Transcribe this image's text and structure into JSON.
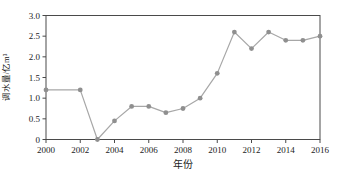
{
  "chart_data": {
    "type": "line",
    "title": "",
    "xlabel": "年份",
    "ylabel": "调水量/亿m³",
    "x": [
      2000,
      2002,
      2003,
      2004,
      2005,
      2006,
      2007,
      2008,
      2009,
      2010,
      2011,
      2012,
      2013,
      2014,
      2015,
      2016
    ],
    "values": [
      1.2,
      1.2,
      0,
      0.45,
      0.8,
      0.8,
      0.65,
      0.75,
      1.0,
      1.6,
      2.6,
      2.2,
      2.6,
      2.4,
      2.4,
      2.5
    ],
    "xlim": [
      2000,
      2016
    ],
    "ylim": [
      0,
      3.0
    ],
    "x_ticks": [
      2000,
      2002,
      2004,
      2006,
      2008,
      2010,
      2012,
      2014,
      2016
    ],
    "x_tick_labels": [
      "2000",
      "2002",
      "2004",
      "2006",
      "2008",
      "2010",
      "2012",
      "2014",
      "2016"
    ],
    "y_ticks": [
      0,
      0.5,
      1.0,
      1.5,
      2.0,
      2.5,
      3.0
    ],
    "y_tick_labels": [
      "0",
      "0.5",
      "1.0",
      "1.5",
      "2.0",
      "2.5",
      "3.0"
    ],
    "grid": false,
    "legend": "none",
    "marker": "circle",
    "line_color": "#a7a7a7",
    "marker_color": "#8f8f8f",
    "axis_color": "#4a4a4a",
    "text_color": "#1c1c1c",
    "background": "#ffffff"
  }
}
